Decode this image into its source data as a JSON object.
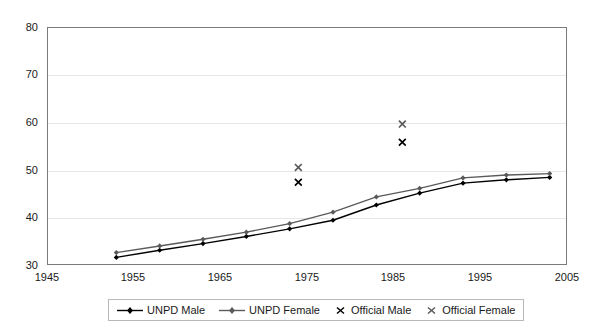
{
  "chart_data": {
    "type": "line",
    "title": "",
    "xlabel": "",
    "ylabel": "",
    "xlim": [
      1945,
      2005
    ],
    "ylim": [
      30,
      80
    ],
    "grid": true,
    "legend_position": "bottom",
    "x_ticks": [
      "1945",
      "1955",
      "1965",
      "1975",
      "1985",
      "1995",
      "2005"
    ],
    "y_ticks": [
      "30",
      "40",
      "50",
      "60",
      "70",
      "80"
    ],
    "series": [
      {
        "name": "UNPD Male",
        "marker": "diamond",
        "color": "#000000",
        "style": "line",
        "x": [
          1953,
          1958,
          1963,
          1968,
          1973,
          1978,
          1983,
          1988,
          1993,
          1998,
          2003
        ],
        "values": [
          31.6,
          33.1,
          34.5,
          36.0,
          37.6,
          39.4,
          42.6,
          45.1,
          47.2,
          47.9,
          48.4
        ]
      },
      {
        "name": "UNPD Female",
        "marker": "diamond",
        "color": "#5a5a5a",
        "style": "line",
        "x": [
          1953,
          1958,
          1963,
          1968,
          1973,
          1978,
          1983,
          1988,
          1993,
          1998,
          2003
        ],
        "values": [
          32.6,
          34.0,
          35.4,
          36.9,
          38.7,
          41.1,
          44.3,
          46.1,
          48.3,
          48.9,
          49.2
        ]
      },
      {
        "name": "Official Male",
        "marker": "x",
        "color": "#000000",
        "style": "scatter",
        "x": [
          1974,
          1986
        ],
        "values": [
          47.4,
          55.8
        ]
      },
      {
        "name": "Official Female",
        "marker": "x",
        "color": "#5a5a5a",
        "style": "scatter",
        "x": [
          1974,
          1986
        ],
        "values": [
          50.5,
          59.6
        ]
      }
    ],
    "legend": [
      {
        "label": "UNPD Male",
        "marker": "line-diamond",
        "color": "#000000"
      },
      {
        "label": "UNPD Female",
        "marker": "line-diamond",
        "color": "#5a5a5a"
      },
      {
        "label": "Official Male",
        "marker": "x",
        "color": "#000000"
      },
      {
        "label": "Official Female",
        "marker": "x",
        "color": "#5a5a5a"
      }
    ]
  }
}
